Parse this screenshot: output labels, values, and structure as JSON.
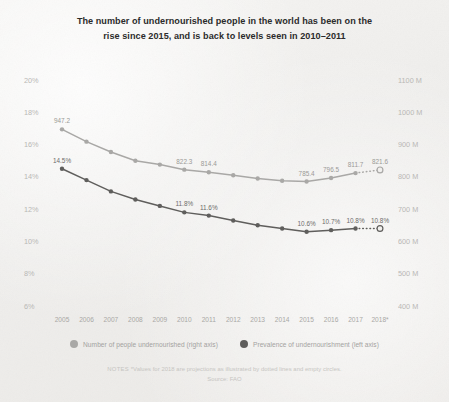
{
  "title": {
    "line1": "The number of undernourished people in the world has been on the",
    "line2": "rise since 2015, and is back to levels seen in 2010–2011"
  },
  "legend": {
    "items": [
      {
        "label": "Number of people undernourished (right axis)",
        "color": "#a9a8a6"
      },
      {
        "label": "Prevalence of undernourishment (left axis)",
        "color": "#5f5e5c"
      }
    ]
  },
  "notes": {
    "label": "NOTES",
    "line1": "*Values for 2018 are projections as illustrated by dotted lines and empty circles.",
    "line2": "Source: FAO"
  },
  "chart_data": {
    "type": "line",
    "title": "The number of undernourished people in the world has been on the rise since 2015, and is back to levels seen in 2010–2011",
    "xlabel": "",
    "grid": false,
    "legend_position": "bottom",
    "x": [
      "2005",
      "2006",
      "2007",
      "2008",
      "2009",
      "2010",
      "2011",
      "2012",
      "2013",
      "2014",
      "2015",
      "2016",
      "2017",
      "2018*"
    ],
    "xtick_labels": [
      "2005",
      "2006",
      "2007",
      "2008",
      "2009",
      "2010",
      "2011",
      "2012",
      "2013",
      "2014",
      "2015",
      "2016",
      "2017",
      "2018*"
    ],
    "left_axis": {
      "label": "Prevalence of undernourishment",
      "ticks": [
        "6%",
        "8%",
        "10%",
        "12%",
        "14%",
        "16%",
        "18%",
        "20%"
      ],
      "tick_values": [
        6,
        8,
        10,
        12,
        14,
        16,
        18,
        20
      ],
      "ylim": [
        6,
        20
      ]
    },
    "right_axis": {
      "label": "Number of people undernourished",
      "ticks": [
        "400 M",
        "500 M",
        "600 M",
        "700 M",
        "800 M",
        "900 M",
        "1000 M",
        "1100 M"
      ],
      "tick_values": [
        400,
        500,
        600,
        700,
        800,
        900,
        1000,
        1100
      ],
      "ylim": [
        400,
        1100
      ]
    },
    "series": [
      {
        "name": "Number of people undernourished (right axis)",
        "axis": "right",
        "color": "#a9a8a6",
        "unit": "M",
        "values": [
          947.2,
          909.0,
          877.0,
          850.0,
          838.0,
          822.3,
          814.4,
          805.0,
          795.0,
          788.0,
          785.4,
          796.5,
          811.7,
          821.6
        ],
        "labels": {
          "2005": "947.2",
          "2010": "822.3",
          "2011": "814.4",
          "2015": "785.4",
          "2016": "796.5",
          "2017": "811.7",
          "2018*": "821.6"
        },
        "projection_from": "2017",
        "projection_to": "2018*"
      },
      {
        "name": "Prevalence of undernourishment (left axis)",
        "axis": "left",
        "color": "#5f5e5c",
        "unit": "%",
        "values": [
          14.5,
          13.8,
          13.1,
          12.6,
          12.2,
          11.8,
          11.6,
          11.3,
          11.0,
          10.8,
          10.6,
          10.7,
          10.8,
          10.8
        ],
        "labels": {
          "2005": "14.5%",
          "2010": "11.8%",
          "2011": "11.6%",
          "2015": "10.6%",
          "2016": "10.7%",
          "2017": "10.8%",
          "2018*": "10.8%"
        },
        "projection_from": "2017",
        "projection_to": "2018*"
      }
    ]
  }
}
